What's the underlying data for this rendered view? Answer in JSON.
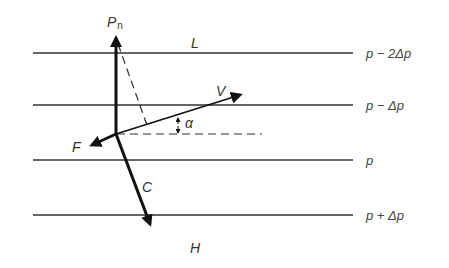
{
  "diagram": {
    "isobars": [
      {
        "y": 53,
        "label": "p − 2Δp"
      },
      {
        "y": 105,
        "label": "p − Δp"
      },
      {
        "y": 160,
        "label": "p"
      },
      {
        "y": 215,
        "label": "p + Δp"
      }
    ],
    "regions": {
      "low": "L",
      "high": "H"
    },
    "vectors": {
      "pressure_gradient": "P",
      "pressure_gradient_sub": "n",
      "velocity": "V",
      "friction": "F",
      "coriolis": "C"
    },
    "angle": "α",
    "colors": {
      "ink": "#1a1a1a",
      "line": "#333333",
      "background": "#ffffff"
    }
  }
}
